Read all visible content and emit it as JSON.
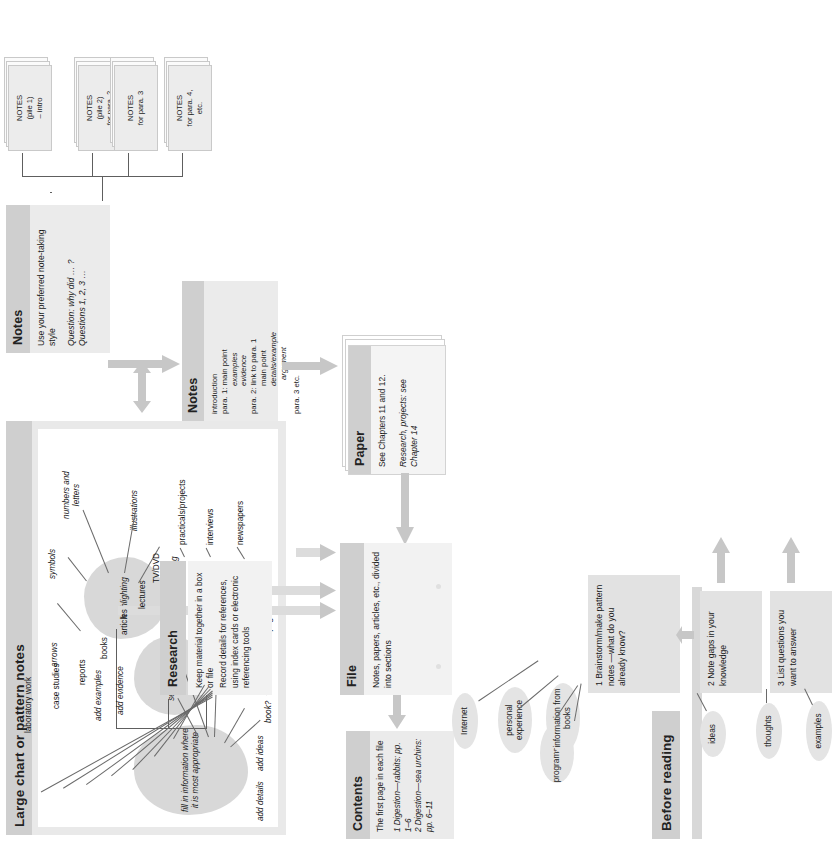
{
  "figure": {
    "title_hidden": "Study / note-taking process flow diagram",
    "orientation": "rotated-90"
  },
  "panels": {
    "large_chart": {
      "heading": "Large chart or pattern notes",
      "clouds": [
        "fill in information where it is most appropriate",
        "see page 247",
        "highlighting"
      ],
      "labels": [
        "add details",
        "add ideas",
        "add examples",
        "add evidence",
        "book?",
        "where from?",
        "page?",
        "arrows",
        "symbols",
        "numbers and letters",
        "illustrations",
        "color-coding"
      ]
    },
    "notes_top": {
      "heading": "Notes",
      "line1": "Use your preferred note-taking style",
      "line2": "Question: why did … ?",
      "line3": "Questions 1, 2, 3 …",
      "piles": [
        "NOTES\n(pile 1)\n– intro",
        "NOTES\n(pile 2)\nfor para. 2",
        "NOTES\nfor para. 3",
        "NOTES\nfor para. 4,\netc."
      ],
      "pile_lines": [
        [
          "NOTES",
          "(pile 1)",
          "– intro"
        ],
        [
          "NOTES",
          "(pile 2)",
          "for para. 2"
        ],
        [
          "NOTES",
          "for para. 3"
        ],
        [
          "NOTES",
          "for para. 4,",
          "etc."
        ]
      ]
    },
    "notes_mid": {
      "heading": "Notes",
      "lines": [
        "introduction",
        "para. 1:  main point",
        "examples",
        "evidence",
        "para. 2: link to para. 1",
        "main point",
        "details/example",
        "argument",
        "para. 3  etc."
      ]
    },
    "research": {
      "heading": "Research",
      "lines": [
        "Keep material together in a box or file",
        "Record details for references, using index cards or electronic referencing tools"
      ],
      "sources_left": [
        "Internet",
        "personal experience",
        "information from books"
      ],
      "sources_top": [
        "laboratory work",
        "case studies",
        "reports",
        "books",
        "articles",
        "lectures",
        "TV/DVD"
      ],
      "sources_bottom": [
        "practicals/projects",
        "interviews",
        "newspapers"
      ]
    },
    "before_reading": {
      "heading": "Before reading",
      "items": [
        "1 Brainstorm/make pattern notes —what do you already know?",
        "2 Note gaps in your knowledge",
        "3 List questions you want to answer"
      ],
      "bubbles": [
        "programs on TV",
        "ideas",
        "thoughts",
        "examples"
      ]
    },
    "paper": {
      "heading": "Paper",
      "line1": "See Chapters 11 and 12.",
      "line2": "Research, projects: see Chapter 14"
    },
    "file": {
      "heading": "File",
      "body": "Notes, papers, articles, etc., divided into sections"
    },
    "contents": {
      "heading": "Contents",
      "line1": "The first page in each file",
      "line2": "1  Digestion—rabbits: pp. 1–6",
      "line3": "2  Digestion—sea urchins: pp. 6–11"
    }
  },
  "colors": {
    "header_grey": "#cfcfcf",
    "body_grey": "#ebebeb",
    "panel_bg": "#e9e9e9",
    "arrow_grey": "#c7c7c7",
    "cloud_grey": "#d8d8d8",
    "line_grey": "#5e5e5e"
  }
}
